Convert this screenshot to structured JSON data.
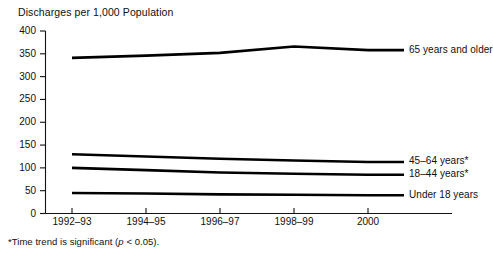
{
  "chart_data": {
    "type": "line",
    "title": "Discharges per 1,000 Population",
    "xlabel": "",
    "ylabel": "Discharges per 1,000 Population",
    "ylim": [
      0,
      400
    ],
    "yticks": [
      0,
      50,
      100,
      150,
      200,
      250,
      300,
      350,
      400
    ],
    "ytick_labels": [
      "0",
      "50",
      "100",
      "150",
      "200",
      "250",
      "300",
      "350",
      "400"
    ],
    "categories": [
      "1992–93",
      "1994–95",
      "1996–97",
      "1998–99",
      "2000"
    ],
    "grid": false,
    "legend_position": "right-inline",
    "series": [
      {
        "name": "65 years and older",
        "label": "65 years and older",
        "values": [
          341,
          346,
          352,
          366,
          358
        ]
      },
      {
        "name": "45–64 years*",
        "label": "45–64 years*",
        "values": [
          130,
          125,
          120,
          116,
          113
        ]
      },
      {
        "name": "18–44 years*",
        "label": "18–44 years*",
        "values": [
          100,
          95,
          90,
          87,
          85
        ]
      },
      {
        "name": "Under 18 years",
        "label": "Under 18 years",
        "values": [
          45,
          44,
          42,
          41,
          40
        ]
      }
    ],
    "footnote_prefix": "*Time trend is significant (",
    "footnote_italic": "p",
    "footnote_suffix": " < 0.05)."
  },
  "footnote_full": "*Time trend is significant (p < 0.05)."
}
